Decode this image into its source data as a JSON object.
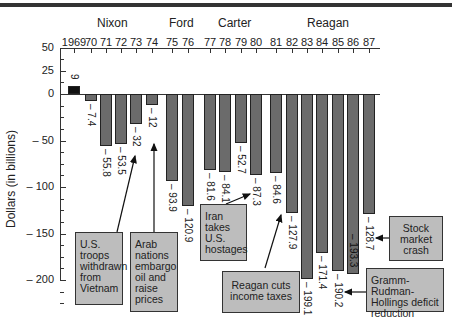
{
  "chart_data": {
    "type": "bar",
    "title": "",
    "ylabel": "Dollars (in billions)",
    "xlabel": "",
    "ylim": [
      -225,
      50
    ],
    "yticks": [
      50,
      25,
      0,
      -50,
      -100,
      -150,
      -200
    ],
    "ytick_labels": [
      "50",
      "25",
      "0",
      "-50",
      "-100",
      "-150",
      "-200"
    ],
    "presidents": [
      {
        "name": "Nixon",
        "years": "1969-1974"
      },
      {
        "name": "Ford",
        "years": "1975-1976"
      },
      {
        "name": "Carter",
        "years": "1977-1980"
      },
      {
        "name": "Reagan",
        "years": "1981-1987"
      }
    ],
    "categories": [
      "1969",
      "70",
      "71",
      "72",
      "73",
      "74",
      "75",
      "76",
      "77",
      "78",
      "79",
      "80",
      "81",
      "82",
      "83",
      "84",
      "85",
      "86",
      "87"
    ],
    "values": [
      9,
      -7.4,
      -55.8,
      -53.5,
      -32,
      -12,
      -93.9,
      -120.9,
      -81.6,
      -84.1,
      -52.7,
      -87.3,
      -84.6,
      -127.9,
      -199.1,
      -171.4,
      -190.2,
      -193.3,
      -128.7
    ],
    "value_labels": [
      "9",
      "– 7.4",
      "– 55.8",
      "– 53.5",
      "– 32",
      "– 12",
      "– 93.9",
      "– 120.9",
      "– 81.6",
      "– 84.1",
      "– 52.7",
      "– 87.3",
      "– 84.6",
      "– 127.9",
      "– 199.1",
      "– 171.4",
      "– 190.2",
      "– 193.3",
      "– 128.7"
    ],
    "annotations": [
      {
        "text": "U.S. troops withdrawn from Vietnam",
        "points_to": "73"
      },
      {
        "text": "Arab nations embargo oil and raise prices",
        "points_to": "74"
      },
      {
        "text": "Iran takes U.S. hostages",
        "points_to": "79"
      },
      {
        "text": "Reagan cuts income taxes",
        "points_to": "81"
      },
      {
        "text": "Stock market crash",
        "points_to": "87"
      },
      {
        "text": "Gramm-Rudman-Hollings deficit reduction",
        "points_to": "85"
      }
    ],
    "grid": false,
    "legend": "none"
  },
  "labels": {
    "pres": [
      "Nixon",
      "Ford",
      "Carter",
      "Reagan"
    ],
    "ytitle": "Dollars (in billions)",
    "notes": [
      "U.S. troops withdrawn from Vietnam",
      "Arab nations embargo oil and raise prices",
      "Iran takes U.S. hostages",
      "Reagan cuts income taxes",
      "Stock market crash",
      "Gramm-Rudman-Hollings deficit reduction"
    ]
  }
}
